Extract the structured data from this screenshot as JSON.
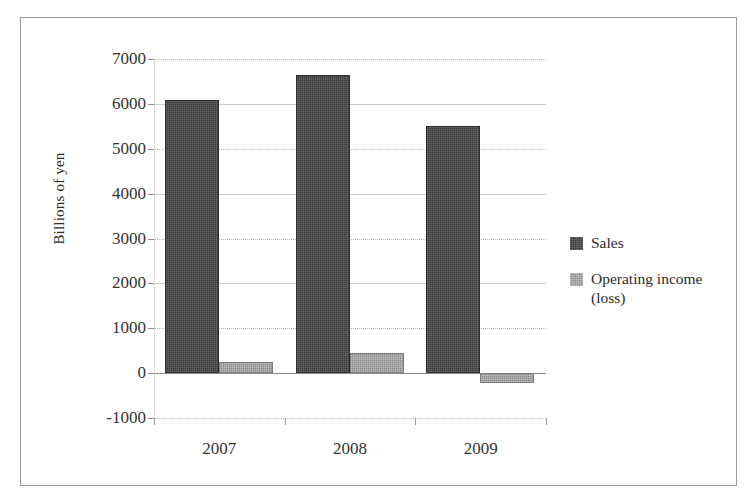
{
  "figure": {
    "y_axis_title": "Billions of yen"
  },
  "chart_data": {
    "type": "bar",
    "title": "",
    "subtitle": "",
    "xlabel": "",
    "ylabel": "Billions of yen",
    "categories": [
      "2007",
      "2008",
      "2009"
    ],
    "series": [
      {
        "name": "Sales",
        "values": [
          6090,
          6640,
          5500
        ],
        "color": "#3c3c3c"
      },
      {
        "name": "Operating income (loss)",
        "values": [
          250,
          450,
          -220
        ],
        "color": "#8d8d8d"
      }
    ],
    "ylim": [
      -1000,
      7000
    ],
    "ytick_labels": [
      "7000",
      "6000",
      "5000",
      "4000",
      "3000",
      "2000",
      "1000",
      "0",
      "-1000"
    ],
    "ytick_values": [
      7000,
      6000,
      5000,
      4000,
      3000,
      2000,
      1000,
      0,
      -1000
    ],
    "grid": true,
    "legend_position": "right",
    "legend": [
      "Sales",
      "Operating income (loss)"
    ]
  }
}
